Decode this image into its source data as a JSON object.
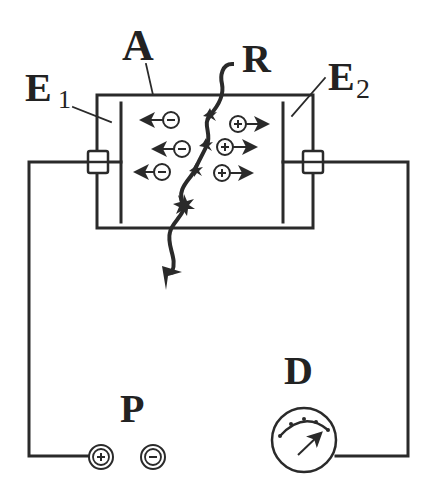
{
  "labels": {
    "chamber": "A",
    "radiation": "R",
    "electrode1_letter": "E",
    "electrode1_sub": "1",
    "electrode2_letter": "E",
    "electrode2_sub": "2",
    "power_source": "P",
    "detector": "D"
  },
  "symbols": {
    "negative_ion": "−",
    "positive_ion": "+",
    "terminal_positive": "+",
    "terminal_negative": "−"
  },
  "colors": {
    "ink": "#2a2a2a",
    "background": "#ffffff"
  }
}
